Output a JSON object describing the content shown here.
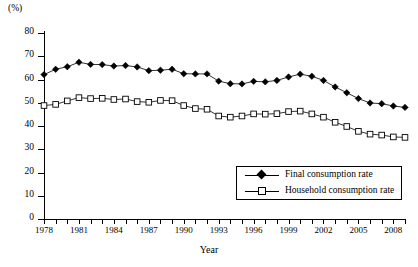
{
  "chart_data": {
    "type": "line",
    "title": "",
    "xlabel": "Year",
    "ylabel": "",
    "unit_label": "(%)",
    "xlim": [
      1978,
      2009
    ],
    "ylim": [
      0,
      80
    ],
    "ytick_step": 10,
    "yticks": [
      80,
      70,
      60,
      50,
      40,
      30,
      20,
      10,
      0
    ],
    "grid": false,
    "legend_position": "inside-bottom-right",
    "x": [
      1978,
      1979,
      1980,
      1981,
      1982,
      1983,
      1984,
      1985,
      1986,
      1987,
      1988,
      1989,
      1990,
      1991,
      1992,
      1993,
      1994,
      1995,
      1996,
      1997,
      1998,
      1999,
      2000,
      2001,
      2002,
      2003,
      2004,
      2005,
      2006,
      2007,
      2008,
      2009
    ],
    "xtick_labels": [
      "1978",
      "1981",
      "1984",
      "1987",
      "1990",
      "1993",
      "1996",
      "1999",
      "2002",
      "2005",
      "2008"
    ],
    "xtick_label_years": [
      1978,
      1981,
      1984,
      1987,
      1990,
      1993,
      1996,
      1999,
      2002,
      2005,
      2008
    ],
    "series": [
      {
        "name": "Final consumption rate",
        "marker": "filled-diamond",
        "color": "#000000",
        "values": [
          62.1,
          64.4,
          65.5,
          67.4,
          66.5,
          66.4,
          65.8,
          66.0,
          65.4,
          63.8,
          64.0,
          64.4,
          62.5,
          62.4,
          62.4,
          59.3,
          58.2,
          58.1,
          59.2,
          59.0,
          59.6,
          61.1,
          62.3,
          61.4,
          59.6,
          56.8,
          54.3,
          51.8,
          49.9,
          49.6,
          48.6,
          48.0
        ]
      },
      {
        "name": "Household consumption rate",
        "marker": "open-square",
        "color": "#000000",
        "values": [
          48.8,
          49.3,
          50.8,
          52.2,
          51.8,
          51.9,
          51.4,
          51.6,
          50.5,
          50.2,
          51.0,
          50.9,
          48.8,
          47.5,
          47.2,
          44.3,
          43.8,
          44.3,
          45.2,
          45.1,
          45.3,
          46.2,
          46.4,
          45.2,
          43.8,
          41.6,
          39.8,
          37.7,
          36.5,
          36.1,
          35.3,
          35.1
        ]
      }
    ]
  },
  "legend": {
    "items": [
      {
        "label": "Final consumption rate",
        "marker": "filled-diamond"
      },
      {
        "label": "Household consumption rate",
        "marker": "open-square"
      }
    ]
  }
}
